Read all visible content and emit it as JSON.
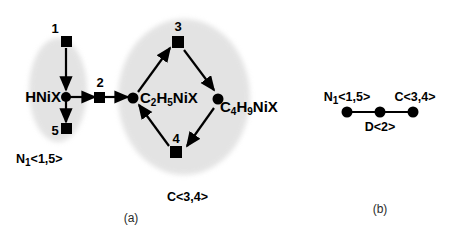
{
  "figure": {
    "panels": [
      {
        "id": "a",
        "caption": "(a)",
        "group_labels": [
          {
            "id": "left-group",
            "text": "N",
            "sub": "1",
            "suffix": "<1,5>"
          },
          {
            "id": "right-group",
            "text": "C",
            "sub": "",
            "suffix": "<3,4>"
          }
        ],
        "nodes": [
          {
            "id": "hnix",
            "label": "HNiX",
            "parts": [
              {
                "t": "HNiX",
                "sub": false
              }
            ],
            "shape": "dot"
          },
          {
            "id": "c2h5nix",
            "label": "C2H5NiX",
            "parts": [
              {
                "t": "C",
                "sub": false
              },
              {
                "t": "2",
                "sub": true
              },
              {
                "t": "H",
                "sub": false
              },
              {
                "t": "5",
                "sub": true
              },
              {
                "t": "NiX",
                "sub": false
              }
            ],
            "shape": "dot"
          },
          {
            "id": "c4h9nix",
            "label": "C4H9NiX",
            "parts": [
              {
                "t": "C",
                "sub": false
              },
              {
                "t": "4",
                "sub": true
              },
              {
                "t": "H",
                "sub": false
              },
              {
                "t": "9",
                "sub": true
              },
              {
                "t": "NiX",
                "sub": false
              }
            ],
            "shape": "dot"
          }
        ],
        "reaction_squares": [
          {
            "id": "r1",
            "index": "1"
          },
          {
            "id": "r2",
            "index": "2"
          },
          {
            "id": "r3",
            "index": "3"
          },
          {
            "id": "r4",
            "index": "4"
          },
          {
            "id": "r5",
            "index": "5"
          }
        ]
      },
      {
        "id": "b",
        "caption": "(b)",
        "nodes": [
          {
            "id": "b-left",
            "text": "N",
            "sub": "1",
            "suffix": "<1,5>"
          },
          {
            "id": "b-middle",
            "text": "D",
            "sub": "",
            "suffix": "<2>"
          },
          {
            "id": "b-right",
            "text": "C",
            "sub": "",
            "suffix": "<3,4>"
          }
        ]
      }
    ],
    "colors": {
      "ink": "#000000",
      "blob": "#d9d9d9",
      "background": "#ffffff",
      "caption": "#2b2b2b"
    }
  }
}
